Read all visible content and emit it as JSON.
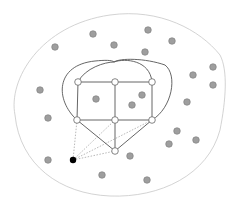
{
  "diagram": {
    "width": 237,
    "height": 203,
    "colors": {
      "background": "#ffffff",
      "boundary": "#c8c8c8",
      "edge": "#555555",
      "dotted_edge": "#9a9a9a",
      "white_node_fill": "#ffffff",
      "white_node_stroke": "#666666",
      "gray_node_fill": "#9e9e9e",
      "gray_node_stroke": "#7a7a7a",
      "black_node_fill": "#000000"
    },
    "boundary_path": "M 15 115 C 8 80, 40 25, 110 15 C 160 8, 200 30, 220 55 C 228 70, 226 100, 220 130 C 208 175, 160 198, 110 196 C 60 194, 20 165, 15 115 Z",
    "white_nodes": [
      {
        "id": "a",
        "x": 78,
        "y": 82
      },
      {
        "id": "b",
        "x": 115,
        "y": 82
      },
      {
        "id": "c",
        "x": 152,
        "y": 82
      },
      {
        "id": "d",
        "x": 77,
        "y": 120
      },
      {
        "id": "e",
        "x": 115,
        "y": 120
      },
      {
        "id": "f",
        "x": 152,
        "y": 120
      },
      {
        "id": "g",
        "x": 115,
        "y": 151
      }
    ],
    "edges": [
      [
        "a",
        "b"
      ],
      [
        "b",
        "c"
      ],
      [
        "d",
        "e"
      ],
      [
        "e",
        "f"
      ],
      [
        "a",
        "d"
      ],
      [
        "b",
        "e"
      ],
      [
        "c",
        "f"
      ],
      [
        "d",
        "g"
      ],
      [
        "e",
        "g"
      ],
      [
        "f",
        "g"
      ]
    ],
    "curves": [
      "M 77 120 C 55 100, 55 65, 95 61 C 105 60, 112 60, 114 62 C 125 58, 150 60, 152 82",
      "M 78 82 C 85 68, 105 62, 114 62 C 120 58, 145 58, 165 65 C 178 75, 172 108, 152 120"
    ],
    "black_node": {
      "x": 73,
      "y": 160
    },
    "dotted_edges_to": [
      "d",
      "e",
      "f",
      "g"
    ],
    "gray_nodes": [
      {
        "x": 93,
        "y": 34
      },
      {
        "x": 148,
        "y": 30
      },
      {
        "x": 172,
        "y": 41
      },
      {
        "x": 55,
        "y": 47
      },
      {
        "x": 114,
        "y": 45
      },
      {
        "x": 145,
        "y": 52
      },
      {
        "x": 213,
        "y": 67
      },
      {
        "x": 193,
        "y": 75
      },
      {
        "x": 213,
        "y": 85
      },
      {
        "x": 40,
        "y": 90
      },
      {
        "x": 96,
        "y": 99
      },
      {
        "x": 142,
        "y": 95
      },
      {
        "x": 132,
        "y": 105
      },
      {
        "x": 187,
        "y": 102
      },
      {
        "x": 48,
        "y": 118
      },
      {
        "x": 177,
        "y": 131
      },
      {
        "x": 196,
        "y": 140
      },
      {
        "x": 169,
        "y": 144
      },
      {
        "x": 48,
        "y": 160
      },
      {
        "x": 130,
        "y": 156
      },
      {
        "x": 102,
        "y": 175
      },
      {
        "x": 147,
        "y": 180
      }
    ]
  }
}
